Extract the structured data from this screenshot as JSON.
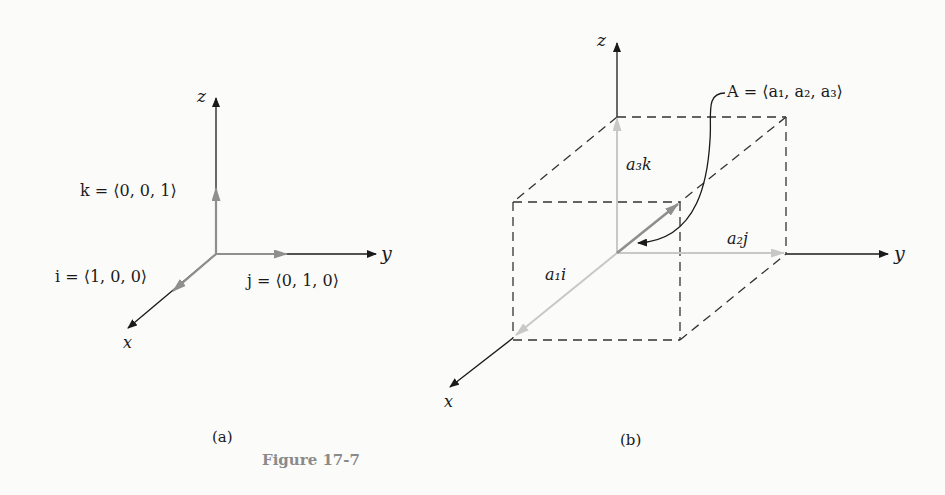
{
  "figure": {
    "caption": "Figure 17-7",
    "panel_a": {
      "label": "(a)",
      "axes": {
        "x": "x",
        "y": "y",
        "z": "z"
      },
      "vectors": {
        "i": "i = ⟨1, 0, 0⟩",
        "j": "j = ⟨0, 1, 0⟩",
        "k": "k = ⟨0, 0, 1⟩"
      }
    },
    "panel_b": {
      "label": "(b)",
      "axes": {
        "x": "x",
        "y": "y",
        "z": "z"
      },
      "vector_A": "A = ⟨a₁, a₂, a₃⟩",
      "components": {
        "a1i": "a₁i",
        "a2j": "a₂j",
        "a3k": "a₃k"
      }
    },
    "colors": {
      "axis": "#1a1a1a",
      "unit_vector": "#8f8f8f",
      "component": "#c8c8c8",
      "dashed_box": "#333333",
      "caption": "#8a8a8a"
    }
  }
}
